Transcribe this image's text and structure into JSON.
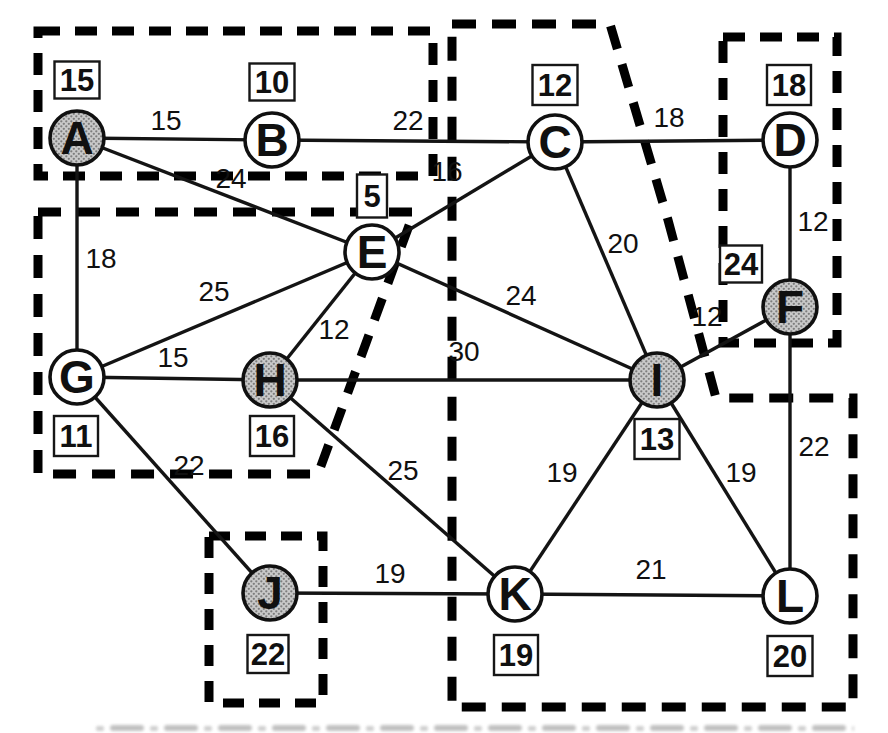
{
  "figure": {
    "ink_color": "#101010",
    "shaded_fill_base": "#c9c9c9",
    "shaded_fill_dot": "#7d7d7d",
    "node_radius": 27,
    "nodes": [
      {
        "id": "A",
        "value": "15",
        "shaded": true,
        "x": 77,
        "y": 138,
        "box_x": 77,
        "box_y": 80,
        "box_w": 45,
        "box_h": 37
      },
      {
        "id": "B",
        "value": "10",
        "shaded": false,
        "x": 272,
        "y": 140,
        "box_x": 272,
        "box_y": 82,
        "box_w": 45,
        "box_h": 37
      },
      {
        "id": "C",
        "value": "12",
        "shaded": false,
        "x": 555,
        "y": 142,
        "box_x": 555,
        "box_y": 85,
        "box_w": 45,
        "box_h": 40
      },
      {
        "id": "D",
        "value": "18",
        "shaded": false,
        "x": 790,
        "y": 140,
        "box_x": 789,
        "box_y": 85,
        "box_w": 44,
        "box_h": 40
      },
      {
        "id": "E",
        "value": "5",
        "shaded": false,
        "x": 372,
        "y": 252,
        "box_x": 372,
        "box_y": 196,
        "box_w": 30,
        "box_h": 43
      },
      {
        "id": "F",
        "value": "24",
        "shaded": true,
        "x": 790,
        "y": 307,
        "box_x": 741,
        "box_y": 264,
        "box_w": 42,
        "box_h": 37
      },
      {
        "id": "G",
        "value": "11",
        "shaded": false,
        "x": 77,
        "y": 377,
        "box_x": 76,
        "box_y": 436,
        "box_w": 44,
        "box_h": 40
      },
      {
        "id": "H",
        "value": "16",
        "shaded": true,
        "x": 270,
        "y": 380,
        "box_x": 272,
        "box_y": 436,
        "box_w": 44,
        "box_h": 40
      },
      {
        "id": "I",
        "value": "13",
        "shaded": true,
        "x": 657,
        "y": 380,
        "box_x": 657,
        "box_y": 439,
        "box_w": 45,
        "box_h": 40
      },
      {
        "id": "J",
        "value": "22",
        "shaded": true,
        "x": 270,
        "y": 593,
        "box_x": 268,
        "box_y": 654,
        "box_w": 41,
        "box_h": 38
      },
      {
        "id": "K",
        "value": "19",
        "shaded": false,
        "x": 515,
        "y": 594,
        "box_x": 516,
        "box_y": 655,
        "box_w": 44,
        "box_h": 40
      },
      {
        "id": "L",
        "value": "20",
        "shaded": false,
        "x": 790,
        "y": 596,
        "box_x": 790,
        "box_y": 656,
        "box_w": 45,
        "box_h": 40
      }
    ],
    "edges": [
      {
        "from": "A",
        "to": "B",
        "weight": "15",
        "wx": 166,
        "wy": 120
      },
      {
        "from": "B",
        "to": "C",
        "weight": "22",
        "wx": 408,
        "wy": 120
      },
      {
        "from": "C",
        "to": "D",
        "weight": "18",
        "wx": 669,
        "wy": 117
      },
      {
        "from": "A",
        "to": "E",
        "weight": "24",
        "wx": 231,
        "wy": 178
      },
      {
        "from": "C",
        "to": "E",
        "weight": "16",
        "wx": 447,
        "wy": 171
      },
      {
        "from": "A",
        "to": "G",
        "weight": "18",
        "wx": 101,
        "wy": 258
      },
      {
        "from": "E",
        "to": "G",
        "weight": "25",
        "wx": 214,
        "wy": 291
      },
      {
        "from": "G",
        "to": "H",
        "weight": "15",
        "wx": 173,
        "wy": 357
      },
      {
        "from": "E",
        "to": "H",
        "weight": "12",
        "wx": 334,
        "wy": 329
      },
      {
        "from": "E",
        "to": "I",
        "weight": "24",
        "wx": 521,
        "wy": 295
      },
      {
        "from": "C",
        "to": "I",
        "weight": "20",
        "wx": 623,
        "wy": 243
      },
      {
        "from": "H",
        "to": "I",
        "weight": "30",
        "wx": 464,
        "wy": 351
      },
      {
        "from": "D",
        "to": "F",
        "weight": "12",
        "wx": 813,
        "wy": 221
      },
      {
        "from": "I",
        "to": "F",
        "weight": "12",
        "wx": 707,
        "wy": 316
      },
      {
        "from": "G",
        "to": "J",
        "weight": "22",
        "wx": 189,
        "wy": 465
      },
      {
        "from": "H",
        "to": "K",
        "weight": "25",
        "wx": 403,
        "wy": 470
      },
      {
        "from": "I",
        "to": "K",
        "weight": "19",
        "wx": 562,
        "wy": 472
      },
      {
        "from": "I",
        "to": "L",
        "weight": "19",
        "wx": 741,
        "wy": 472
      },
      {
        "from": "J",
        "to": "K",
        "weight": "19",
        "wx": 390,
        "wy": 573
      },
      {
        "from": "K",
        "to": "L",
        "weight": "21",
        "wx": 651,
        "wy": 569
      },
      {
        "from": "F",
        "to": "L",
        "weight": "22",
        "wx": 814,
        "wy": 446
      }
    ],
    "clusters": [
      {
        "name": "cluster-A-B",
        "members": "A,B",
        "dash": "22 15",
        "points": "38,31 433,31 433,176 38,176"
      },
      {
        "name": "cluster-E-G-H",
        "members": "E,G,H",
        "dash": "23 16",
        "points": "38,212 414,212 318,474 38,474"
      },
      {
        "name": "cluster-C-I-K-L",
        "members": "C,I,K,L",
        "dash": "24 16",
        "points": "452,24 610,24 668,220 716,398 853,398 853,707 452,707"
      },
      {
        "name": "cluster-D-F",
        "members": "D,F",
        "dash": "22 15",
        "points": "723,37 837,37 837,343 723,343"
      },
      {
        "name": "cluster-J",
        "members": "J",
        "dash": "21 15",
        "points": "209,536 323,536 323,703 209,703"
      }
    ],
    "caption_cutoff": {
      "x": 92,
      "y": 721,
      "width": 762,
      "height": 12
    }
  }
}
